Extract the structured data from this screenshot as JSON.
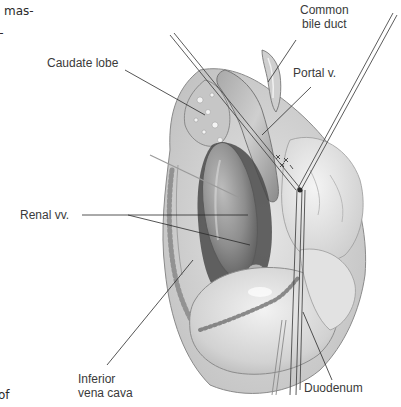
{
  "page_fragments": {
    "top_line_1": "mas-",
    "top_line_2": "l-",
    "bottom_line": "of"
  },
  "figure": {
    "labels": {
      "common_bile_duct": "Common\nbile duct",
      "portal_vein": "Portal v.",
      "caudate_lobe": "Caudate lobe",
      "renal_veins": "Renal vv.",
      "inferior_vena_cava": "Inferior\nvena cava",
      "duodenum": "Duodenum"
    }
  },
  "colors": {
    "background": "#ffffff",
    "label_text": "#3a3a3a",
    "leader_line": "#2a2a2a",
    "tissue_dark": "#6e6e6e",
    "tissue_mid": "#9a9a9a",
    "tissue_light": "#d4d4d4",
    "tissue_highlight": "#eeeeee"
  }
}
